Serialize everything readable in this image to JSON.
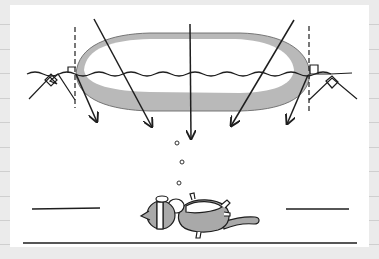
{
  "illustration": {
    "subject": "light refraction through lens-shaped body onto sleeping cat",
    "colors": {
      "background": "#ebebeb",
      "panel": "#ffffff",
      "ink": "#1e1e1e",
      "lens_shade": "#b9b9b9",
      "cat_fill": "#a9a9a9",
      "rule": "#cfcfcf"
    },
    "margin_rule_y": [
      24,
      49,
      73,
      98,
      122,
      147,
      171,
      196,
      220,
      244
    ],
    "arrows": [
      {
        "from": [
          94,
          19
        ],
        "to": [
          97,
          122
        ]
      },
      {
        "from": [
          94,
          19
        ],
        "to": [
          152,
          127
        ]
      },
      {
        "from": [
          190,
          24
        ],
        "to": [
          191,
          139
        ]
      },
      {
        "from": [
          294,
          20
        ],
        "to": [
          231,
          126
        ]
      },
      {
        "from": [
          310,
          75
        ],
        "to": [
          287,
          124
        ]
      }
    ],
    "bubbles": [
      [
        178,
        143
      ],
      [
        182,
        161
      ],
      [
        180,
        183
      ]
    ],
    "icons": [
      "arrow-icon",
      "cat-icon",
      "bubble-icon",
      "right-angle-marker-icon"
    ]
  }
}
